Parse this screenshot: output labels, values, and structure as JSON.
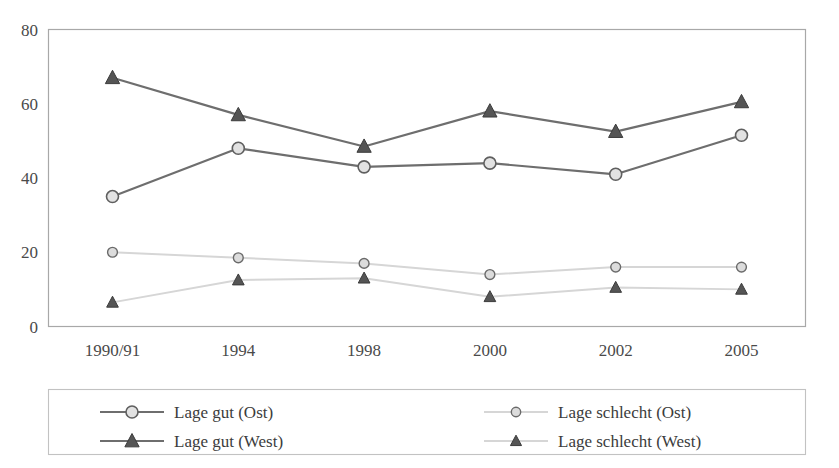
{
  "chart_data": {
    "type": "line",
    "title": "",
    "subtitle": "",
    "xlabel": "",
    "ylabel": "",
    "categories": [
      "1990/91",
      "1994",
      "1998",
      "2000",
      "2002",
      "2005"
    ],
    "ylim": [
      0,
      80
    ],
    "yticks": [
      0,
      20,
      40,
      60,
      80
    ],
    "ytick_labels": [
      "0",
      "20",
      "40",
      "60",
      "80"
    ],
    "grid": false,
    "legend_position": "bottom",
    "series": [
      {
        "name": "Lage gut (Ost)",
        "marker": "circle",
        "style": "dark",
        "color": "#6e6e6e",
        "values": [
          35,
          48,
          43,
          44,
          41,
          51.5
        ]
      },
      {
        "name": "Lage gut (West)",
        "marker": "triangle",
        "style": "dark",
        "color": "#6e6e6e",
        "values": [
          67,
          57,
          48.5,
          58,
          52.5,
          60.5
        ]
      },
      {
        "name": "Lage schlecht (Ost)",
        "marker": "circle",
        "style": "light",
        "color": "#d6d6d6",
        "values": [
          20,
          18.5,
          17,
          14,
          16,
          16
        ]
      },
      {
        "name": "Lage schlecht (West)",
        "marker": "triangle",
        "style": "light",
        "color": "#d6d6d6",
        "values": [
          6.5,
          12.5,
          13,
          8,
          10.5,
          10
        ]
      }
    ]
  },
  "legend": {
    "entries": [
      {
        "label": "Lage gut (Ost)",
        "marker": "circle",
        "style": "dark"
      },
      {
        "label": "Lage schlecht (Ost)",
        "marker": "circle",
        "style": "light"
      },
      {
        "label": "Lage gut (West)",
        "marker": "triangle",
        "style": "dark"
      },
      {
        "label": "Lage schlecht (West)",
        "marker": "triangle",
        "style": "light"
      }
    ]
  },
  "colors": {
    "dark_line": "#6e6e6e",
    "light_line": "#d6d6d6",
    "marker_fill": "#e2e2e2",
    "marker_stroke": "#5f5f5f",
    "triangle_fill": "#555555",
    "frame": "#a8a8a8",
    "text": "#3a3a3a",
    "background": "#ffffff"
  }
}
